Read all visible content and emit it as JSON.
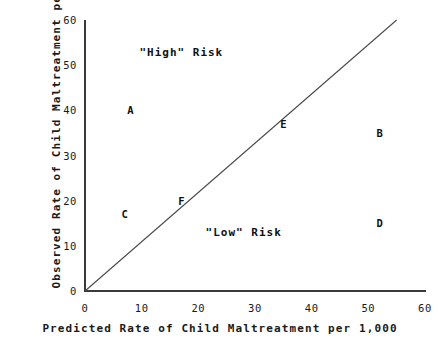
{
  "chart_data": {
    "type": "scatter",
    "title": "",
    "xlabel": "Predicted Rate of Child Maltreatment per 1,000",
    "ylabel": "Observed Rate of Child Maltreatment per 1,000",
    "xlim": [
      0,
      60
    ],
    "ylim": [
      0,
      60
    ],
    "xticks": [
      0,
      10,
      20,
      30,
      40,
      50,
      60
    ],
    "yticks": [
      0,
      10,
      20,
      30,
      40,
      50,
      60
    ],
    "xtick_labels": [
      "0",
      "10",
      "20",
      "30",
      "40",
      "50",
      "60"
    ],
    "ytick_labels": [
      "0",
      "10",
      "20",
      "30",
      "40",
      "50",
      "60"
    ],
    "grid": false,
    "legend": "none",
    "points": [
      {
        "label": "A",
        "x": 8,
        "y": 40
      },
      {
        "label": "B",
        "x": 52,
        "y": 35
      },
      {
        "label": "C",
        "x": 7,
        "y": 17
      },
      {
        "label": "D",
        "x": 52,
        "y": 15
      },
      {
        "label": "E",
        "x": 35,
        "y": 37
      },
      {
        "label": "F",
        "x": 17,
        "y": 20
      }
    ],
    "reference_line": {
      "description": "45-degree identity line",
      "from": [
        0,
        0
      ],
      "to": [
        55,
        60
      ]
    },
    "annotations": [
      {
        "text": "\"High\" Risk",
        "x": 17,
        "y": 53
      },
      {
        "text": "\"Low\" Risk",
        "x": 28,
        "y": 13
      }
    ]
  }
}
